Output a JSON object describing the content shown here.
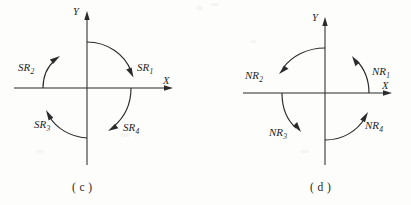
{
  "figure": {
    "background_color": "#fdfdfc",
    "ink_color": "#2b2b2b",
    "panels": [
      {
        "id": "c",
        "caption": "( c )",
        "axis_x_label": "X",
        "axis_y_label": "Y",
        "rotation_sense": "clockwise",
        "arcs": [
          {
            "label_prefix": "SR",
            "label_sub": "1",
            "label_full": "SR1",
            "quadrant": "I",
            "arrow_direction": "down-right"
          },
          {
            "label_prefix": "SR",
            "label_sub": "2",
            "label_full": "SR2",
            "quadrant": "II",
            "arrow_direction": "up-right"
          },
          {
            "label_prefix": "SR",
            "label_sub": "3",
            "label_full": "SR3",
            "quadrant": "III",
            "arrow_direction": "up-left"
          },
          {
            "label_prefix": "SR",
            "label_sub": "4",
            "label_full": "SR4",
            "quadrant": "IV",
            "arrow_direction": "down-left"
          }
        ]
      },
      {
        "id": "d",
        "caption": "( d )",
        "axis_x_label": "X",
        "axis_y_label": "Y",
        "rotation_sense": "counterclockwise",
        "arcs": [
          {
            "label_prefix": "NR",
            "label_sub": "1",
            "label_full": "NR1",
            "quadrant": "I",
            "arrow_direction": "up-left"
          },
          {
            "label_prefix": "NR",
            "label_sub": "2",
            "label_full": "NR2",
            "quadrant": "II",
            "arrow_direction": "down-left"
          },
          {
            "label_prefix": "NR",
            "label_sub": "3",
            "label_full": "NR3",
            "quadrant": "III",
            "arrow_direction": "down-right"
          },
          {
            "label_prefix": "NR",
            "label_sub": "4",
            "label_full": "NR4",
            "quadrant": "IV",
            "arrow_direction": "up-right"
          }
        ]
      }
    ]
  }
}
